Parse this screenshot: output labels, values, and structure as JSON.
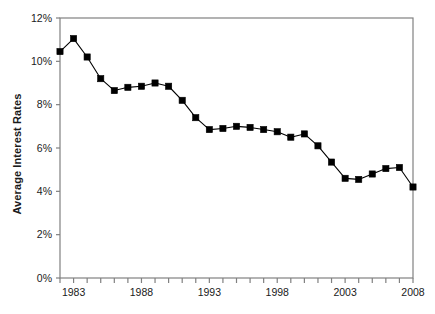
{
  "chart_data": {
    "type": "line",
    "title": "",
    "xlabel": "",
    "ylabel": "Average Interest Rates",
    "xlim": [
      1982,
      2008
    ],
    "ylim": [
      0,
      12
    ],
    "grid": false,
    "legend": "none",
    "marker": "square",
    "line_color": "#000000",
    "marker_color": "#000000",
    "axis_color": "#808080",
    "x_tick_labels": [
      "1983",
      "1988",
      "1993",
      "1998",
      "2003",
      "2008"
    ],
    "x_tick_label_years": [
      1983,
      1988,
      1993,
      1998,
      2003,
      2008
    ],
    "x_minor_tick_years": [
      1982,
      1983,
      1984,
      1985,
      1986,
      1987,
      1988,
      1989,
      1990,
      1991,
      1992,
      1993,
      1994,
      1995,
      1996,
      1997,
      1998,
      1999,
      2000,
      2001,
      2002,
      2003,
      2004,
      2005,
      2006,
      2007,
      2008
    ],
    "y_tick_labels": [
      "0%",
      "2%",
      "4%",
      "6%",
      "8%",
      "10%",
      "12%"
    ],
    "y_tick_values": [
      0,
      2,
      4,
      6,
      8,
      10,
      12
    ],
    "x": [
      1982,
      1983,
      1984,
      1985,
      1986,
      1987,
      1988,
      1989,
      1990,
      1991,
      1992,
      1993,
      1994,
      1995,
      1996,
      1997,
      1998,
      1999,
      2000,
      2001,
      2002,
      2003,
      2004,
      2005,
      2006,
      2007,
      2008
    ],
    "values": [
      10.45,
      11.05,
      10.2,
      9.2,
      8.65,
      8.8,
      8.85,
      9.0,
      8.85,
      8.2,
      7.4,
      6.85,
      6.9,
      7.0,
      6.95,
      6.85,
      6.75,
      6.5,
      6.65,
      6.1,
      5.35,
      4.6,
      4.55,
      4.8,
      5.05,
      5.1,
      4.2
    ],
    "series": [
      {
        "name": "Average Interest Rates",
        "values": [
          10.45,
          11.05,
          10.2,
          9.2,
          8.65,
          8.8,
          8.85,
          9.0,
          8.85,
          8.2,
          7.4,
          6.85,
          6.9,
          7.0,
          6.95,
          6.85,
          6.75,
          6.5,
          6.65,
          6.1,
          5.35,
          4.6,
          4.55,
          4.8,
          5.05,
          5.1,
          4.2
        ]
      }
    ]
  }
}
